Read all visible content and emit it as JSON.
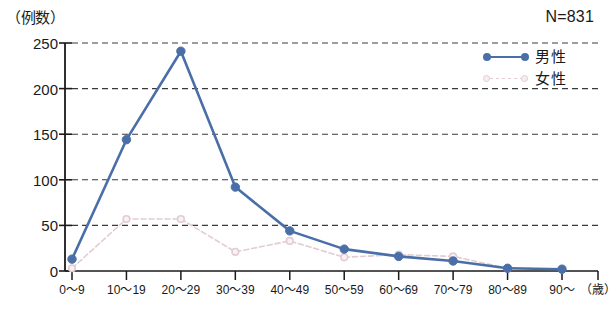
{
  "chart_data": {
    "type": "line",
    "title": "",
    "ylabel": "（例数）",
    "xlabel": "（歳）",
    "annotation": "N=831",
    "categories": [
      "0〜9",
      "10〜19",
      "20〜29",
      "30〜39",
      "40〜49",
      "50〜59",
      "60〜69",
      "70〜79",
      "80〜89",
      "90〜"
    ],
    "yticks": [
      0,
      50,
      100,
      150,
      200,
      250
    ],
    "ylim": [
      0,
      250
    ],
    "grid": true,
    "legend_position": "top-right",
    "series": [
      {
        "name": "男性",
        "color": "#4a6fa8",
        "style": "solid",
        "marker": "filled-circle",
        "values": [
          13,
          144,
          241,
          92,
          44,
          24,
          16,
          11,
          3,
          2
        ]
      },
      {
        "name": "女性",
        "color": "#e2ccd2",
        "style": "dashed",
        "marker": "hollow-circle",
        "values": [
          3,
          57,
          57,
          21,
          33,
          15,
          18,
          16,
          3,
          2
        ]
      }
    ]
  },
  "legend": {
    "items": [
      {
        "label": "男性"
      },
      {
        "label": "女性"
      }
    ]
  },
  "colors": {
    "male": "#4a6fa8",
    "female": "#e2ccd2",
    "axis": "#1a1a1a",
    "grid": "#3a3a3a",
    "background": "#ffffff"
  }
}
